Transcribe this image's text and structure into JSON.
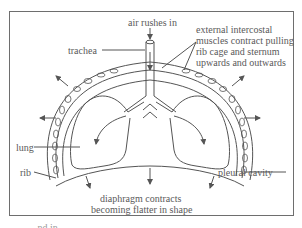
{
  "diagram": {
    "labels": {
      "air_in": "air rushes in",
      "trachea": "trachea",
      "intercostal": [
        "external intercostal",
        "muscles contract pulling",
        "rib cage and sternum",
        "upwards and outwards"
      ],
      "lung": "lung",
      "rib": "rib",
      "pleural": "pleural cavity",
      "diaphragm": [
        "diaphragm contracts",
        "becoming flatter in shape"
      ]
    },
    "caption_cut": "...nd in..."
  },
  "colors": {
    "line": "#555555",
    "text": "#5a5a5a",
    "frame": "#6e6e6e"
  }
}
